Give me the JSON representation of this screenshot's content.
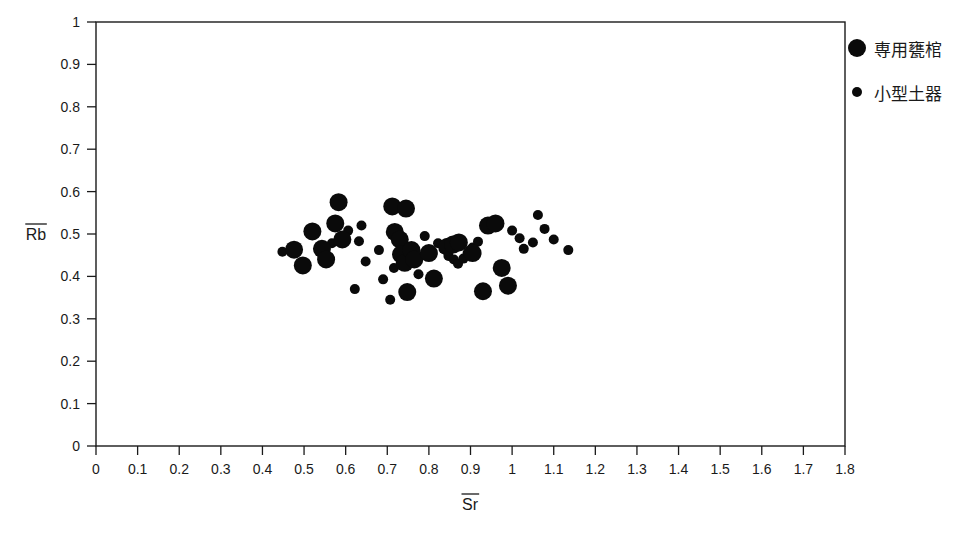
{
  "figure": {
    "background_color": "#ffffff",
    "marker_color": "#0a0a0a",
    "axis_color": "#1a1a1a"
  },
  "legend": {
    "position": "top-right",
    "items": [
      {
        "label": "専用甕棺",
        "marker": "large-filled-circle",
        "radius": 9
      },
      {
        "label": "小型土器",
        "marker": "small-filled-circle",
        "radius": 5
      }
    ]
  },
  "chart_data": {
    "type": "scatter",
    "title": "",
    "xlabel": "Sr",
    "ylabel": "Rb",
    "xlabel_overbar": true,
    "ylabel_overbar": true,
    "xlim": [
      0,
      1.8
    ],
    "ylim": [
      0,
      1
    ],
    "xticks": [
      "0",
      "0.1",
      "0.2",
      "0.3",
      "0.4",
      "0.5",
      "0.6",
      "0.7",
      "0.8",
      "0.9",
      "1",
      "1.1",
      "1.2",
      "1.3",
      "1.4",
      "1.5",
      "1.6",
      "1.7",
      "1.8"
    ],
    "yticks": [
      "0",
      "0.1",
      "0.2",
      "0.3",
      "0.4",
      "0.5",
      "0.6",
      "0.7",
      "0.8",
      "0.9",
      "1"
    ],
    "xtick_values": [
      0,
      0.1,
      0.2,
      0.3,
      0.4,
      0.5,
      0.6,
      0.7,
      0.8,
      0.9,
      1.0,
      1.1,
      1.2,
      1.3,
      1.4,
      1.5,
      1.6,
      1.7,
      1.8
    ],
    "ytick_values": [
      0,
      0.1,
      0.2,
      0.3,
      0.4,
      0.5,
      0.6,
      0.7,
      0.8,
      0.9,
      1.0
    ],
    "grid": false,
    "series": [
      {
        "name": "専用甕棺",
        "marker": "large-filled-circle",
        "marker_radius": 9,
        "points": [
          [
            0.476,
            0.463
          ],
          [
            0.497,
            0.426
          ],
          [
            0.52,
            0.506
          ],
          [
            0.543,
            0.465
          ],
          [
            0.553,
            0.44
          ],
          [
            0.575,
            0.525
          ],
          [
            0.583,
            0.575
          ],
          [
            0.592,
            0.487
          ],
          [
            0.712,
            0.565
          ],
          [
            0.745,
            0.56
          ],
          [
            0.718,
            0.505
          ],
          [
            0.73,
            0.487
          ],
          [
            0.733,
            0.452
          ],
          [
            0.742,
            0.432
          ],
          [
            0.758,
            0.462
          ],
          [
            0.765,
            0.44
          ],
          [
            0.748,
            0.363
          ],
          [
            0.8,
            0.455
          ],
          [
            0.812,
            0.395
          ],
          [
            0.845,
            0.47
          ],
          [
            0.858,
            0.475
          ],
          [
            0.872,
            0.48
          ],
          [
            0.905,
            0.455
          ],
          [
            0.93,
            0.365
          ],
          [
            0.942,
            0.52
          ],
          [
            0.96,
            0.525
          ],
          [
            0.975,
            0.42
          ],
          [
            0.99,
            0.378
          ]
        ]
      },
      {
        "name": "小型土器",
        "marker": "small-filled-circle",
        "marker_radius": 5,
        "points": [
          [
            0.448,
            0.458
          ],
          [
            0.567,
            0.478
          ],
          [
            0.606,
            0.508
          ],
          [
            0.632,
            0.483
          ],
          [
            0.638,
            0.52
          ],
          [
            0.622,
            0.37
          ],
          [
            0.648,
            0.435
          ],
          [
            0.68,
            0.462
          ],
          [
            0.69,
            0.393
          ],
          [
            0.707,
            0.345
          ],
          [
            0.716,
            0.42
          ],
          [
            0.775,
            0.405
          ],
          [
            0.79,
            0.495
          ],
          [
            0.822,
            0.478
          ],
          [
            0.835,
            0.465
          ],
          [
            0.847,
            0.448
          ],
          [
            0.86,
            0.44
          ],
          [
            0.87,
            0.43
          ],
          [
            0.883,
            0.442
          ],
          [
            0.893,
            0.455
          ],
          [
            0.905,
            0.468
          ],
          [
            0.918,
            0.482
          ],
          [
            1.0,
            0.508
          ],
          [
            1.018,
            0.49
          ],
          [
            1.028,
            0.465
          ],
          [
            1.05,
            0.48
          ],
          [
            1.062,
            0.545
          ],
          [
            1.078,
            0.512
          ],
          [
            1.1,
            0.487
          ],
          [
            1.135,
            0.462
          ]
        ]
      }
    ]
  }
}
